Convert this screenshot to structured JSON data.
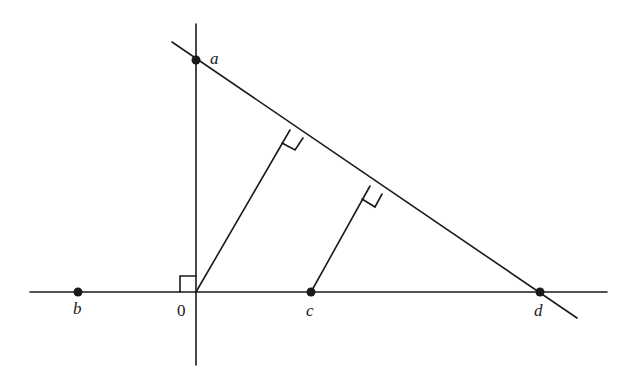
{
  "diagram": {
    "type": "geometry-figure",
    "colors": {
      "ink": "#1a1a1a",
      "background": "#ffffff"
    },
    "labels": {
      "a": "a",
      "b": "b",
      "origin": "0",
      "c": "c",
      "d": "d"
    },
    "points": [
      {
        "id": "a",
        "x": 196,
        "y": 60
      },
      {
        "id": "b",
        "x": 78,
        "y": 292
      },
      {
        "id": "origin",
        "x": 196,
        "y": 292
      },
      {
        "id": "c",
        "x": 311,
        "y": 292
      },
      {
        "id": "d",
        "x": 540,
        "y": 292
      }
    ],
    "right_angle_markers": [
      "origin (between axes)",
      "foot of perpendicular from 0 to line ad",
      "foot of perpendicular from c to line ad"
    ]
  }
}
